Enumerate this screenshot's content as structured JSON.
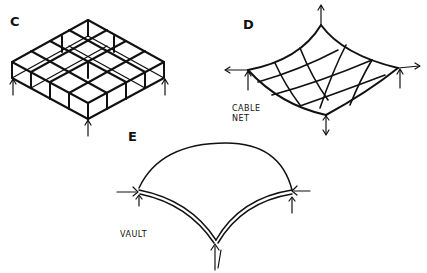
{
  "diagrams": {
    "c": {
      "label": "C",
      "description": "space frame grid slab"
    },
    "d": {
      "label": "D",
      "caption_line1": "CABLE",
      "caption_line2": "NET"
    },
    "e": {
      "label": "E",
      "caption": "VAULT"
    }
  }
}
